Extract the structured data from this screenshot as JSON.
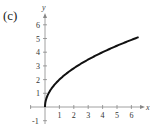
{
  "panel_label": "(c)",
  "chart_data": {
    "type": "line",
    "title": "",
    "xlabel": "x",
    "ylabel": "y",
    "xlim": [
      -1,
      6.8
    ],
    "ylim": [
      -1,
      6.8
    ],
    "x_ticks": [
      "1",
      "2",
      "3",
      "4",
      "5",
      "6"
    ],
    "y_ticks": [
      "-1",
      "1",
      "2",
      "3",
      "4",
      "5",
      "6"
    ],
    "grid": false,
    "legend": null,
    "series": [
      {
        "name": "y = 2√x",
        "x": [
          0,
          0.05,
          0.25,
          0.5,
          1,
          1.5,
          2,
          3,
          4,
          5,
          6,
          6.5
        ],
        "values": [
          0,
          0.45,
          1.0,
          1.41,
          2.0,
          2.45,
          2.83,
          3.46,
          4.0,
          4.47,
          4.9,
          5.1
        ]
      }
    ],
    "colors": {
      "curve": "#111111",
      "axes": "#888888"
    }
  }
}
